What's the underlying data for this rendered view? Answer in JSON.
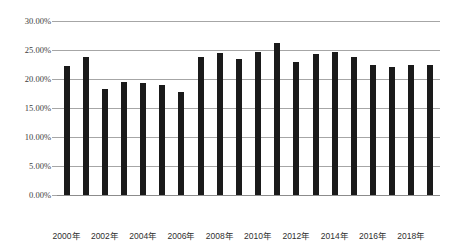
{
  "chart_data": {
    "type": "bar",
    "title": "",
    "subtitle": "",
    "xlabel": "",
    "ylabel": "",
    "grid": true,
    "legend": false,
    "legend_position": "none",
    "ylim": [
      0,
      30
    ],
    "y_unit": "%",
    "y_ticks": [
      "0.00%",
      "5.00%",
      "10.00%",
      "15.00%",
      "20.00%",
      "25.00%",
      "30.00%"
    ],
    "y_tick_values": [
      0,
      5,
      10,
      15,
      20,
      25,
      30
    ],
    "bar_color": "#1a1a1a",
    "gridline_color": "#a6a6a6",
    "categories": [
      "2000年",
      "2001年",
      "2002年",
      "2003年",
      "2004年",
      "2005年",
      "2006年",
      "2007年",
      "2008年",
      "2009年",
      "2010年",
      "2011年",
      "2012年",
      "2013年",
      "2014年",
      "2015年",
      "2016年",
      "2017年",
      "2018年",
      "2019年"
    ],
    "x_tick_labels": [
      "2000年",
      "2002年",
      "2004年",
      "2006年",
      "2008年",
      "2010年",
      "2012年",
      "2014年",
      "2016年",
      "2018年"
    ],
    "x_tick_indices": [
      0,
      2,
      4,
      6,
      8,
      10,
      12,
      14,
      16,
      18
    ],
    "values": [
      22.2,
      23.8,
      18.3,
      19.5,
      19.3,
      19.0,
      17.8,
      23.8,
      24.5,
      23.5,
      24.7,
      26.3,
      23.0,
      24.3,
      24.6,
      23.8,
      22.4,
      22.0,
      22.5,
      22.4
    ]
  }
}
